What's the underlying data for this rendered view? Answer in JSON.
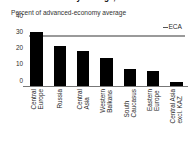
{
  "chart_data": {
    "type": "bar",
    "title": "advanced-economy average, 2013",
    "subtitle": "Percent of advanced-economy average",
    "xlabel": "",
    "ylabel": "",
    "ylim": [
      0,
      40
    ],
    "yticks": [
      40,
      30,
      20,
      10,
      0
    ],
    "grid": false,
    "legend_position": "top-right",
    "categories": [
      "Central Europe",
      "Russia",
      "Central Asia",
      "Western Balkans",
      "South Caucasus",
      "Eastern Europe",
      "Central Asia excl. KAZ"
    ],
    "category_lines": [
      [
        "Central",
        "Europe"
      ],
      [
        "Russia",
        ""
      ],
      [
        "Central",
        "Asia"
      ],
      [
        "Western",
        "Balkans"
      ],
      [
        "South",
        "Caucasus"
      ],
      [
        "Eastern",
        "Europe"
      ],
      [
        "Central Asia",
        "excl. KAZ"
      ]
    ],
    "values": [
      34,
      25,
      22,
      18,
      11,
      10,
      3
    ],
    "series": [
      {
        "name": "Percent of advanced-economy average",
        "values": [
          34,
          25,
          22,
          18,
          11,
          10,
          3
        ],
        "color": "#000000"
      }
    ],
    "annotations": [
      {
        "name": "ECA",
        "label": "ECA",
        "type": "reference-line",
        "value": 31,
        "color": "#9a9a9a"
      }
    ]
  },
  "legend": {
    "eca_label": "ECA"
  },
  "colors": {
    "bar": "#000000",
    "reference_line": "#9a9a9a",
    "axis": "#777777",
    "background": "#ffffff",
    "text": "#262626"
  }
}
